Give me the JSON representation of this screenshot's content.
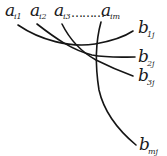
{
  "diagram": {
    "type": "bipartite-curve-mapping",
    "top_labels": [
      {
        "base": "a",
        "sub": "i1"
      },
      {
        "base": "a",
        "sub": "i2"
      },
      {
        "base": "a",
        "sub": "i3"
      },
      {
        "base": "a",
        "sub": "im"
      }
    ],
    "ellipsis": "………",
    "right_labels": [
      {
        "base": "b",
        "sub": "1j"
      },
      {
        "base": "b",
        "sub": "2j"
      },
      {
        "base": "b",
        "sub": "3j"
      },
      {
        "base": "b",
        "sub": "mj"
      }
    ],
    "connections": [
      {
        "from": "a_i1",
        "to": "b_1j"
      },
      {
        "from": "a_i2",
        "to": "b_2j"
      },
      {
        "from": "a_i3",
        "to": "b_3j"
      },
      {
        "from": "a_im",
        "to": "b_mj"
      }
    ],
    "stroke_color": "#151515",
    "background": "#ffffff"
  }
}
